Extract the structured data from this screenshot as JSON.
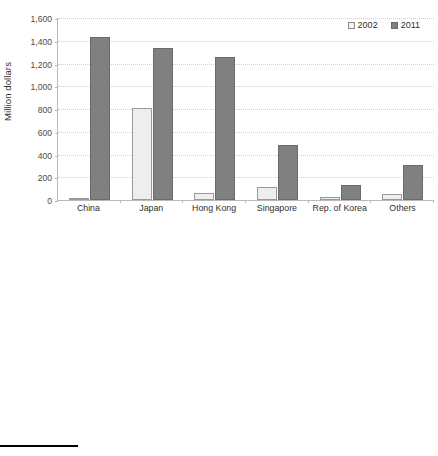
{
  "figure": {
    "legend_labels": [
      "2002",
      "2011"
    ],
    "series_colors": {
      "2002": "#eeeeee",
      "2011": "#808080"
    }
  },
  "chart_data": [
    {
      "type": "bar",
      "title": "",
      "xlabel": "",
      "ylabel": "Million dollars",
      "ylim": [
        0,
        1600
      ],
      "ytick_labels": [
        "1,600",
        "1,400",
        "1,200",
        "1,000",
        "800",
        "600",
        "400",
        "200",
        "0"
      ],
      "ytick_values": [
        1600,
        1400,
        1200,
        1000,
        800,
        600,
        400,
        200,
        0
      ],
      "grid": true,
      "legend_position": "top-right",
      "categories": [
        "China",
        "Japan",
        "Hong Kong",
        "Singapore",
        "Rep. of Korea",
        "Others"
      ],
      "series": [
        {
          "name": "2002",
          "values": [
            20,
            808,
            62,
            115,
            30,
            50
          ]
        },
        {
          "name": "2011",
          "values": [
            1435,
            1335,
            1260,
            480,
            130,
            305
          ]
        }
      ]
    },
    {
      "type": "bar",
      "title": "",
      "xlabel": "",
      "ylabel": "Million litres",
      "ylim": [
        0,
        400
      ],
      "ytick_labels": [
        "400",
        "350",
        "300",
        "250",
        "200",
        "150",
        "100",
        "50",
        "0"
      ],
      "ytick_values": [
        400,
        350,
        300,
        250,
        200,
        150,
        100,
        50,
        0
      ],
      "grid": true,
      "legend_position": "top-right",
      "categories": [
        "China",
        "Japan",
        "Hong Kong",
        "Singapore",
        "Rep. of Korea",
        "Others"
      ],
      "series": [
        {
          "name": "2002",
          "values": [
            31,
            174,
            11,
            11,
            11,
            19
          ]
        },
        {
          "name": "2011",
          "values": [
            365,
            215,
            49,
            27,
            26,
            73
          ]
        }
      ]
    }
  ]
}
